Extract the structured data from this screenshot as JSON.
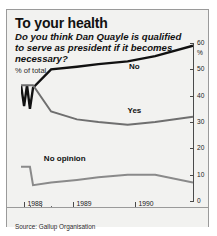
{
  "title": "To your health",
  "subtitle": "Do you think Dan Quayle is qualified to serve as president if it becomes necessary?",
  "unit_label": "% of total",
  "source": "Source: Gallup Organisation",
  "chart_data": {
    "type": "line",
    "title": "To your health",
    "subtitle": "Do you think Dan Quayle is qualified to serve as president if it becomes necessary?",
    "xlabel": "",
    "ylabel": "% of total",
    "ylim": [
      0,
      60
    ],
    "yticks": [
      0,
      10,
      20,
      30,
      40,
      50,
      60
    ],
    "ytick_labels": [
      "0",
      "10",
      "20",
      "30",
      "40",
      "50",
      "60"
    ],
    "y_axis_position": "right",
    "percent_symbol": "%",
    "grid": false,
    "legend": "inline-labels",
    "x_year_ticks": [
      {
        "label": "1988",
        "pos": 0.02
      },
      {
        "label": "1989",
        "pos": 0.305
      },
      {
        "label": "1990",
        "pos": 0.665
      }
    ],
    "x_month_ticks": [
      {
        "label": "A S O",
        "pos": 0.055
      },
      {
        "label": "May",
        "pos": 0.41
      },
      {
        "label": "March",
        "pos": 0.735
      },
      {
        "label": "November",
        "pos": 0.955
      }
    ],
    "x": [
      0.0,
      0.018,
      0.035,
      0.052,
      0.07,
      0.175,
      0.325,
      0.45,
      0.62,
      0.78,
      1.0
    ],
    "series": [
      {
        "name": "No",
        "color": "#111111",
        "width": 2.4,
        "values": [
          44,
          36,
          44,
          35,
          43,
          50,
          51,
          52,
          53,
          55,
          59
        ],
        "label_pos": {
          "x": 0.66,
          "y": 51
        }
      },
      {
        "name": "Yes",
        "color": "#6f6f6f",
        "width": 2.0,
        "values": [
          44,
          44,
          44,
          44,
          44,
          34,
          31,
          30,
          29,
          30,
          32
        ],
        "label_pos": {
          "x": 0.66,
          "y": 34
        }
      },
      {
        "name": "No opinion",
        "color": "#8a8a8a",
        "width": 2.0,
        "values": [
          13,
          13,
          13,
          13,
          6,
          7,
          8,
          9,
          10,
          10,
          7
        ],
        "label_pos": {
          "x": 0.255,
          "y": 16
        }
      }
    ]
  }
}
